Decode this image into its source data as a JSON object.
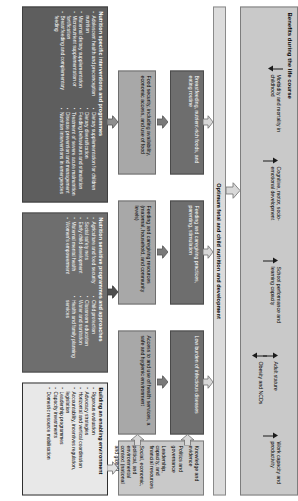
{
  "figure": {
    "type": "conceptual-framework-diagram"
  },
  "benefits_panel": {
    "title": "Benefits during the life course",
    "items": [
      {
        "label": "Morbidity and mortality in childhood",
        "direction": "down"
      },
      {
        "label": "Cognitive, motor, socio-emotional development",
        "direction": "up"
      },
      {
        "label": "School performance and learning capacity",
        "direction": "up"
      },
      {
        "label": "Adult stature",
        "direction": "up"
      },
      {
        "label": "Obesity and NCDs",
        "direction": "down"
      },
      {
        "label": "Work capacity and productivity",
        "direction": "up"
      }
    ]
  },
  "outcome_bar": {
    "label": "Optimum fetal and child nutrition and development"
  },
  "outcomes": [
    {
      "label": "Breastfeeding, nutrient-rich foods, and eating routine"
    },
    {
      "label": "Feeding and caregiving practices, parenting, stimulation"
    },
    {
      "label": "Low burden of infectious diseases"
    },
    {
      "label": "Food security, including availability, economic access, and use of food"
    },
    {
      "label": "Feeding and caregiving resources (maternal, household, and community levels)"
    },
    {
      "label": "Access to and use of health services, a safe and hygienic environment"
    }
  ],
  "nutrition_specific": {
    "title": "Nutrition specific interventions and programmes",
    "items": [
      "Adolescent health and preconception nutrition",
      "Maternal dietary supplementation",
      "Micronutrient supplementation or fortification",
      "Breastfeeding and complementary feeding",
      "Dietary supplementation for children",
      "Dietary diversification",
      "Feeding behaviours and stimulation",
      "Treatment of severe acute malnutrition",
      "Disease prevention and management",
      "Nutrition interventions in emergencies"
    ]
  },
  "nutrition_sensitive": {
    "title": "Nutrition sensitive programmes and approaches",
    "items": [
      "Agriculture and food security",
      "Social safety nets",
      "Early child development",
      "Maternal mental health",
      "Women's empowerment",
      "Child protection",
      "Classroom education",
      "Water and sanitation",
      "Health and family planning services"
    ]
  },
  "knowledge_box": {
    "lines": [
      "Knowledge and evidence",
      "Politics and governance",
      "Leadership, capacity, and financial resources",
      "Social, economic, political, and environmental context (national and global)"
    ]
  },
  "enabling_environment": {
    "title": "Building an enabling environment",
    "items": [
      "Rigorous evaluation",
      "Advocacy strategies",
      "Horizontal and vertical coordination",
      "Accountability, incentives regulation, legislation",
      "Leadership programmes",
      "Capacity investments",
      "Domestic resource mobilisation"
    ]
  },
  "colors": {
    "light": "#c9c9c9",
    "mid": "#a8a8a8",
    "dark": "#6e6e6e",
    "darker": "#5e5e5e",
    "outline": "#2f2f2f"
  }
}
